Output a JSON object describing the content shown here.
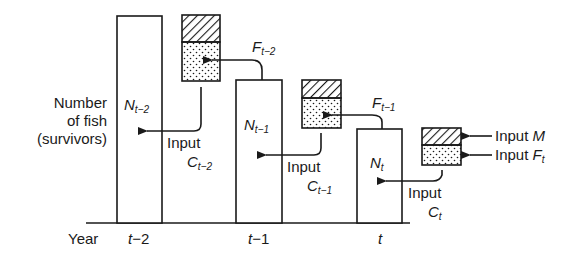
{
  "diagram": {
    "type": "stock-flow",
    "y_axis_label": [
      "Number",
      "of fish",
      "(survivors)"
    ],
    "x_axis_label": "Year",
    "years": [
      {
        "label_main": "t",
        "label_suffix": "−2",
        "n_main": "N",
        "n_sub": "t−2"
      },
      {
        "label_main": "t",
        "label_suffix": "−1",
        "n_main": "N",
        "n_sub": "t−1"
      },
      {
        "label_main": "t",
        "label_suffix": "",
        "n_main": "N",
        "n_sub": "t"
      }
    ],
    "inputs": [
      {
        "input_word": "Input",
        "c_main": "C",
        "c_sub": "t−2",
        "f_main": "F",
        "f_sub": "t−2"
      },
      {
        "input_word": "Input",
        "c_main": "C",
        "c_sub": "t−1",
        "f_main": "F",
        "f_sub": "t−1"
      },
      {
        "input_word": "Input",
        "c_main": "C",
        "c_sub": "t"
      }
    ],
    "legend": {
      "hatched": {
        "prefix": "Input",
        "symbol": "M"
      },
      "dotted": {
        "prefix": "Input",
        "symbol": "F",
        "symbol_sub": "t"
      }
    },
    "colors": {
      "ink": "#1a1a1a",
      "background": "#ffffff"
    }
  }
}
